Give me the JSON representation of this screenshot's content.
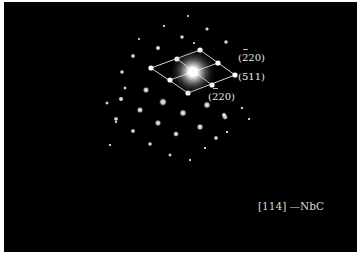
{
  "figure": {
    "type": "electron-diffraction-pattern",
    "background_color": "#000000",
    "border_color": "#ffffff",
    "zone_axis_caption": "[114] —NbC",
    "labels": [
      {
        "id": "top",
        "text": "(220)",
        "overbar_index": 0,
        "display": "(2̅ 20)"
      },
      {
        "id": "right",
        "text": "(511)",
        "overbar_index": -1,
        "display": "(511)"
      },
      {
        "id": "bottom",
        "text": "(220)",
        "overbar_index": 0,
        "display": "(2̅ 20)"
      }
    ],
    "unit_cell": {
      "center": [
        193,
        72
      ],
      "vertices": {
        "left": [
          151,
          68
        ],
        "top": [
          200,
          50
        ],
        "right": [
          235,
          75
        ],
        "bottom": [
          188,
          93
        ]
      },
      "midpoints": [
        [
          177,
          59
        ],
        [
          218,
          63
        ],
        [
          170,
          80
        ],
        [
          212,
          85
        ]
      ]
    },
    "spots": [
      [
        163,
        102,
        2.4
      ],
      [
        207,
        105,
        2.2
      ],
      [
        140,
        110,
        2.0
      ],
      [
        183,
        113,
        2.2
      ],
      [
        225,
        117,
        1.8
      ],
      [
        116,
        119,
        1.5
      ],
      [
        158,
        123,
        2.0
      ],
      [
        200,
        127,
        2.1
      ],
      [
        133,
        131,
        1.5
      ],
      [
        176,
        134,
        1.8
      ],
      [
        216,
        138,
        1.5
      ],
      [
        150,
        144,
        1.4
      ],
      [
        170,
        155,
        1.2
      ],
      [
        190,
        160,
        1.0
      ],
      [
        164,
        26,
        1.0
      ],
      [
        182,
        37,
        1.4
      ],
      [
        207,
        29,
        1.3
      ],
      [
        158,
        48,
        1.6
      ],
      [
        226,
        42,
        1.4
      ],
      [
        188,
        16,
        0.8
      ],
      [
        194,
        43,
        0.8
      ],
      [
        139,
        39,
        0.8
      ],
      [
        133,
        56,
        1.5
      ],
      [
        122,
        72,
        1.4
      ],
      [
        146,
        90,
        2.0
      ],
      [
        121,
        99,
        1.6
      ],
      [
        107,
        103,
        1.2
      ],
      [
        125,
        88,
        1.2
      ],
      [
        224,
        115,
        1.6
      ],
      [
        242,
        108,
        1.0
      ],
      [
        249,
        119,
        1.0
      ],
      [
        227,
        132,
        1.0
      ],
      [
        110,
        145,
        1.0
      ],
      [
        205,
        148,
        1.0
      ],
      [
        116,
        122,
        1.0
      ]
    ]
  }
}
